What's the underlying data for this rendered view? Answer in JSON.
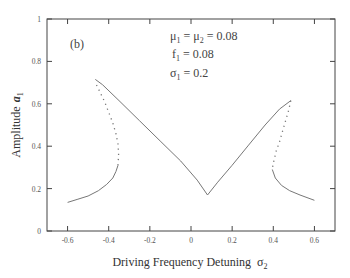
{
  "chart_data": {
    "type": "line",
    "panel_label": "(b)",
    "title": "",
    "xlabel": "Driving Frequency Detuning",
    "xlabel_symbol": "σ",
    "xlabel_symbol_sub": "2",
    "ylabel": "Amplitude",
    "ylabel_symbol": "a",
    "ylabel_symbol_sub": "1",
    "xlim": [
      -0.7,
      0.7
    ],
    "ylim": [
      0,
      1
    ],
    "xticks": [
      -0.6,
      -0.4,
      -0.2,
      0,
      0.2,
      0.4,
      0.6
    ],
    "xtick_labels": [
      "-0.6",
      "-0.4",
      "-0.2",
      "0",
      "0.2",
      "0.4",
      "0.6"
    ],
    "yticks": [
      0,
      0.2,
      0.4,
      0.6,
      0.8,
      1
    ],
    "ytick_labels": [
      "0",
      "0.2",
      "0.4",
      "0.6",
      "0.8",
      "1"
    ],
    "grid": false,
    "legend": null,
    "annotations": [
      {
        "text": "μ₁ = μ₂ = 0.08",
        "main": "μ",
        "sub": "1",
        "rest": " = μ",
        "sub2": "2",
        "tail": " = 0.08"
      },
      {
        "text": "f₁ = 0.08",
        "main": "f",
        "sub": "1",
        "tail": " = 0.08"
      },
      {
        "text": "σ₁ = 0.2",
        "main": "σ",
        "sub": "1",
        "tail": " = 0.2"
      }
    ],
    "series": [
      {
        "name": "stable-left-lower",
        "style": "solid",
        "x": [
          -0.6,
          -0.55,
          -0.5,
          -0.45,
          -0.41,
          -0.38,
          -0.365,
          -0.355
        ],
        "y": [
          0.135,
          0.15,
          0.165,
          0.19,
          0.22,
          0.25,
          0.28,
          0.31
        ]
      },
      {
        "name": "unstable-left",
        "style": "dotted",
        "x": [
          -0.355,
          -0.352,
          -0.355,
          -0.365,
          -0.38,
          -0.4,
          -0.42,
          -0.445,
          -0.465
        ],
        "y": [
          0.31,
          0.36,
          0.41,
          0.46,
          0.51,
          0.56,
          0.61,
          0.66,
          0.7
        ]
      },
      {
        "name": "stable-center",
        "style": "solid",
        "x": [
          -0.465,
          -0.43,
          -0.35,
          -0.25,
          -0.15,
          -0.05,
          0.03,
          0.08,
          0.13,
          0.2,
          0.28,
          0.36,
          0.43,
          0.485
        ],
        "y": [
          0.715,
          0.69,
          0.615,
          0.52,
          0.425,
          0.33,
          0.24,
          0.17,
          0.23,
          0.31,
          0.405,
          0.5,
          0.575,
          0.615
        ]
      },
      {
        "name": "unstable-right",
        "style": "dotted",
        "x": [
          0.485,
          0.475,
          0.46,
          0.445,
          0.43,
          0.415,
          0.405,
          0.398,
          0.395
        ],
        "y": [
          0.615,
          0.57,
          0.52,
          0.47,
          0.42,
          0.38,
          0.34,
          0.31,
          0.29
        ]
      },
      {
        "name": "stable-right-lower",
        "style": "solid",
        "x": [
          0.395,
          0.41,
          0.44,
          0.48,
          0.53,
          0.6
        ],
        "y": [
          0.29,
          0.25,
          0.215,
          0.19,
          0.17,
          0.145
        ]
      }
    ]
  },
  "colors": {
    "axis": "#444444",
    "curve": "#777777",
    "text": "#444444"
  }
}
